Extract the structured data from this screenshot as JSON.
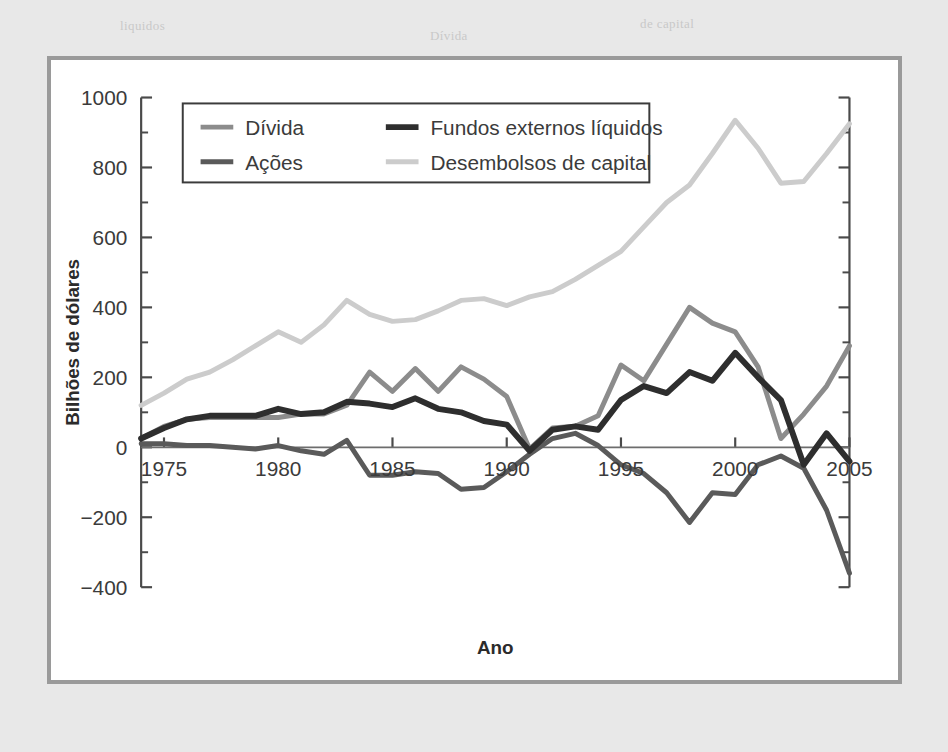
{
  "page": {
    "background_color": "#e8e8e8",
    "panel_background_color": "#ffffff",
    "panel_border_color": "#9a9a9a"
  },
  "chart_data": {
    "type": "line",
    "title": "",
    "xlabel": "Ano",
    "ylabel": "Bilhões de dólares",
    "xlim": [
      1974,
      2005
    ],
    "ylim": [
      -400,
      1000
    ],
    "ytick_step": 200,
    "yminor_step": 100,
    "grid": false,
    "legend_position": "top-left-inside",
    "x_tick_labels": [
      "1975",
      "1980",
      "1985",
      "1990",
      "1995",
      "2000",
      "2005"
    ],
    "x_ticks": [
      1975,
      1980,
      1985,
      1990,
      1995,
      2000,
      2005
    ],
    "y_tick_labels": [
      "1000",
      "800",
      "600",
      "400",
      "200",
      "0",
      "−200",
      "−400"
    ],
    "y_ticks": [
      1000,
      800,
      600,
      400,
      200,
      0,
      -200,
      -400
    ],
    "x": [
      1974,
      1975,
      1976,
      1977,
      1978,
      1979,
      1980,
      1981,
      1982,
      1983,
      1984,
      1985,
      1986,
      1987,
      1988,
      1989,
      1990,
      1991,
      1992,
      1993,
      1994,
      1995,
      1996,
      1997,
      1998,
      1999,
      2000,
      2001,
      2002,
      2003,
      2004,
      2005
    ],
    "series": [
      {
        "name": "Dívida",
        "color": "#8c8c8c",
        "width": 5,
        "values": [
          25,
          60,
          80,
          85,
          85,
          85,
          85,
          95,
          95,
          120,
          215,
          160,
          225,
          160,
          230,
          195,
          145,
          -5,
          55,
          60,
          90,
          235,
          190,
          295,
          400,
          355,
          330,
          230,
          25,
          95,
          175,
          290
        ]
      },
      {
        "name": "Ações",
        "color": "#5a5a5a",
        "width": 5,
        "values": [
          10,
          10,
          5,
          5,
          0,
          -5,
          5,
          -10,
          -20,
          20,
          -80,
          -80,
          -70,
          -75,
          -120,
          -115,
          -70,
          -20,
          25,
          40,
          5,
          -50,
          -75,
          -130,
          -215,
          -130,
          -135,
          -50,
          -25,
          -60,
          -180,
          -360
        ]
      },
      {
        "name": "Fundos externos líquidos",
        "color": "#2e2e2e",
        "width": 6,
        "values": [
          25,
          55,
          80,
          90,
          90,
          90,
          110,
          95,
          100,
          130,
          125,
          115,
          140,
          110,
          100,
          75,
          65,
          -10,
          50,
          60,
          50,
          135,
          175,
          155,
          215,
          190,
          270,
          200,
          135,
          -50,
          40,
          -40
        ]
      },
      {
        "name": "Desembolsos de capital",
        "color": "#cccccc",
        "width": 5,
        "values": [
          120,
          155,
          195,
          215,
          250,
          290,
          330,
          300,
          350,
          420,
          380,
          360,
          365,
          390,
          420,
          425,
          405,
          430,
          445,
          480,
          520,
          560,
          630,
          700,
          750,
          840,
          935,
          855,
          755,
          760,
          840,
          925
        ]
      }
    ]
  },
  "legend": {
    "entries": [
      {
        "label": "Dívida",
        "color": "#8c8c8c"
      },
      {
        "label": "Ações",
        "color": "#5a5a5a"
      },
      {
        "label": "Fundos externos líquidos",
        "color": "#2e2e2e"
      },
      {
        "label": "Desembolsos de capital",
        "color": "#cccccc"
      }
    ]
  },
  "bleed_text": [
    {
      "t": "de capital",
      "x": 640,
      "y": 16
    },
    {
      "t": "Dívida",
      "x": 430,
      "y": 28
    },
    {
      "t": "liquidos",
      "x": 120,
      "y": 18
    },
    {
      "t": "as empresas",
      "x": 520,
      "y": 70
    },
    {
      "t": "recursos",
      "x": 520,
      "y": 96
    },
    {
      "t": "externos",
      "x": 520,
      "y": 122
    },
    {
      "t": "o capital",
      "x": 520,
      "y": 150
    },
    {
      "t": "de 15 anos",
      "x": 520,
      "y": 176
    },
    {
      "t": "o",
      "x": 520,
      "y": 204
    },
    {
      "t": "ACOES",
      "x": 130,
      "y": 416
    },
    {
      "t": "a",
      "x": 520,
      "y": 560
    },
    {
      "t": "de",
      "x": 520,
      "y": 588
    },
    {
      "t": "um",
      "x": 520,
      "y": 616
    }
  ]
}
